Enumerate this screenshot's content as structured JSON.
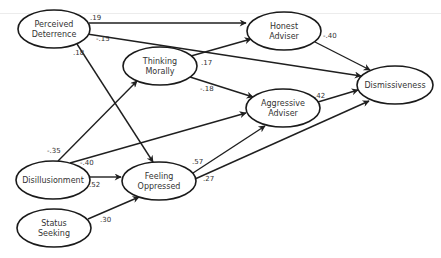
{
  "diagram": {
    "type": "path-diagram",
    "nodes": [
      {
        "id": "perceived_deterrence",
        "line1": "Perceived",
        "line2": "Deterrence",
        "cx": 54,
        "cy": 29,
        "rx": 36,
        "ry": 19
      },
      {
        "id": "honest_adviser",
        "line1": "Honest",
        "line2": "Adviser",
        "cx": 284,
        "cy": 31,
        "rx": 37,
        "ry": 19
      },
      {
        "id": "thinking_morally",
        "line1": "Thinking",
        "line2": "Morally",
        "cx": 160,
        "cy": 66,
        "rx": 37,
        "ry": 19
      },
      {
        "id": "aggressive_adviser",
        "line1": "Aggressive",
        "line2": "Adviser",
        "cx": 283,
        "cy": 108,
        "rx": 37,
        "ry": 19
      },
      {
        "id": "dismissiveness",
        "line1": "Dismissiveness",
        "line2": "",
        "cx": 395,
        "cy": 85,
        "rx": 38,
        "ry": 19
      },
      {
        "id": "disillusionment",
        "line1": "Disillusionment",
        "line2": "",
        "cx": 53,
        "cy": 180,
        "rx": 37,
        "ry": 19
      },
      {
        "id": "feeling_oppressed",
        "line1": "Feeling",
        "line2": "Oppressed",
        "cx": 159,
        "cy": 181,
        "rx": 37,
        "ry": 19
      },
      {
        "id": "status_seeking",
        "line1": "Status",
        "line2": "Seeking",
        "cx": 54,
        "cy": 228,
        "rx": 37,
        "ry": 19
      }
    ],
    "edges": [
      {
        "from": "perceived_deterrence",
        "to": "honest_adviser",
        "coef": ".19"
      },
      {
        "from": "perceived_deterrence",
        "to": "dismissiveness",
        "coef": "-.15"
      },
      {
        "from": "perceived_deterrence",
        "to": "feeling_oppressed",
        "coef": ".18"
      },
      {
        "from": "thinking_morally",
        "to": "honest_adviser",
        "coef": ".17"
      },
      {
        "from": "thinking_morally",
        "to": "aggressive_adviser",
        "coef": "-.18"
      },
      {
        "from": "honest_adviser",
        "to": "dismissiveness",
        "coef": "-.40"
      },
      {
        "from": "aggressive_adviser",
        "to": "dismissiveness",
        "coef": ".42"
      },
      {
        "from": "disillusionment",
        "to": "thinking_morally",
        "coef": "-.35"
      },
      {
        "from": "disillusionment",
        "to": "aggressive_adviser",
        "coef": "-.40"
      },
      {
        "from": "disillusionment",
        "to": "feeling_oppressed",
        "coef": ".52"
      },
      {
        "from": "status_seeking",
        "to": "feeling_oppressed",
        "coef": ".30"
      },
      {
        "from": "feeling_oppressed",
        "to": "aggressive_adviser",
        "coef": ".57"
      },
      {
        "from": "feeling_oppressed",
        "to": "dismissiveness",
        "coef": ".27"
      }
    ]
  }
}
